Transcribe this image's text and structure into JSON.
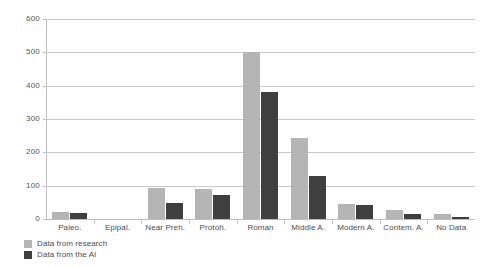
{
  "chart_data": {
    "type": "bar",
    "title": "",
    "xlabel": "",
    "ylabel": "",
    "ylim": [
      0,
      600
    ],
    "yticks": [
      0,
      100,
      200,
      300,
      400,
      500,
      600
    ],
    "ytick_labels": [
      "0",
      "100",
      "200",
      "300",
      "400",
      "500",
      "600"
    ],
    "grid": true,
    "legend_position": "bottom-left",
    "categories": [
      "Paleo.",
      "Epipal.",
      "Near Preh.",
      "Protoh.",
      "Roman",
      "Middle A.",
      "Modern A.",
      "Contem. A.",
      "No Data"
    ],
    "series": [
      {
        "name": "Data from research",
        "color": "#b5b5b5",
        "values": [
          20,
          0,
          92,
          90,
          500,
          243,
          46,
          28,
          16
        ]
      },
      {
        "name": "Data from the AI",
        "color": "#3f3f3f",
        "values": [
          18,
          0,
          47,
          73,
          380,
          130,
          43,
          14,
          5
        ]
      }
    ]
  },
  "legend": {
    "items": [
      {
        "label": "Data from research",
        "color": "#b5b5b5"
      },
      {
        "label": "Data from the AI",
        "color": "#3f3f3f"
      }
    ]
  },
  "colors": {
    "research": "#b5b5b5",
    "ai": "#3f3f3f",
    "gridline": "#c9c9c9",
    "axis": "#bfbfbf",
    "text": "#4d4d4d",
    "background": "#ffffff"
  }
}
